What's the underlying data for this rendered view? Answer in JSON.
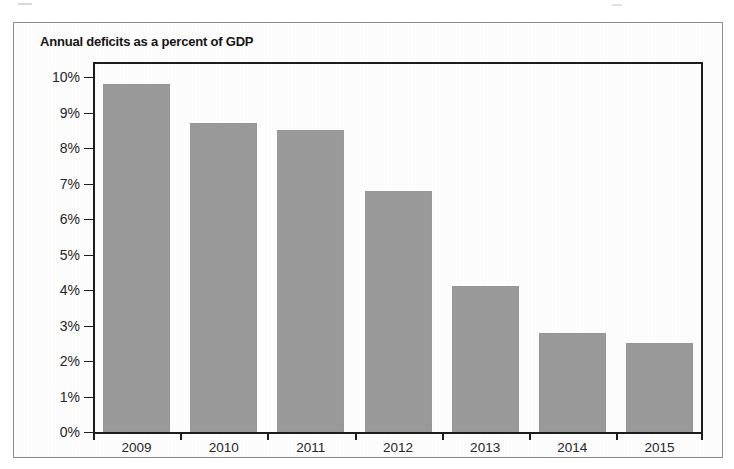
{
  "figure": {
    "title": "Annual deficits as a percent of GDP"
  },
  "chart_data": {
    "type": "bar",
    "title": "Annual deficits as a percent of GDP",
    "categories": [
      "2009",
      "2010",
      "2011",
      "2012",
      "2013",
      "2014",
      "2015"
    ],
    "values": [
      9.8,
      8.7,
      8.5,
      6.8,
      4.1,
      2.8,
      2.5
    ],
    "value_unit": "%",
    "xlabel": "",
    "ylabel": "",
    "ylim": [
      0,
      10
    ],
    "ytick_labels": [
      "10%",
      "9%",
      "8%",
      "7%",
      "6%",
      "5%",
      "4%",
      "3%",
      "2%",
      "1%",
      "0%"
    ],
    "ytick_values": [
      10,
      9,
      8,
      7,
      6,
      5,
      4,
      3,
      2,
      1,
      0
    ],
    "grid": false,
    "legend": null,
    "bar_color": "#9b9b9b",
    "axis_color": "#1d1d1d"
  }
}
